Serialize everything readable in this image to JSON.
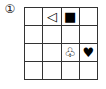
{
  "label": "①",
  "grid": {
    "rows": 4,
    "cols": 4,
    "cells": [
      [
        "",
        "◁",
        "■",
        ""
      ],
      [
        "",
        "",
        "",
        ""
      ],
      [
        "",
        "",
        "♧",
        "♥"
      ],
      [
        "",
        "",
        "",
        ""
      ]
    ],
    "symbol_names": {
      "◁": "triangle-left-outline-icon",
      "■": "square-filled-icon",
      "♧": "clover-outline-icon",
      "♥": "heart-filled-icon"
    }
  }
}
